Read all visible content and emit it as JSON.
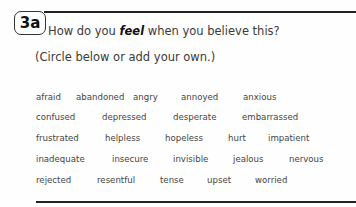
{
  "section": {
    "badge": "3a",
    "question_part1": "How do you ",
    "question_emphasis": "feel",
    "question_part2": " when you believe this?",
    "instruction": "(Circle below or add your own.)"
  },
  "feelings": {
    "rows": [
      [
        "afraid",
        "abandoned",
        "angry",
        "annoyed",
        "anxious"
      ],
      [
        "confused",
        "depressed",
        "desperate",
        "embarrassed"
      ],
      [
        "frustrated",
        "helpless",
        "hopeless",
        "hurt",
        "impatient"
      ],
      [
        "inadequate",
        "insecure",
        "invisible",
        "jealous",
        "nervous"
      ],
      [
        "rejected",
        "resentful",
        "tense",
        "upset",
        "worried"
      ]
    ]
  }
}
